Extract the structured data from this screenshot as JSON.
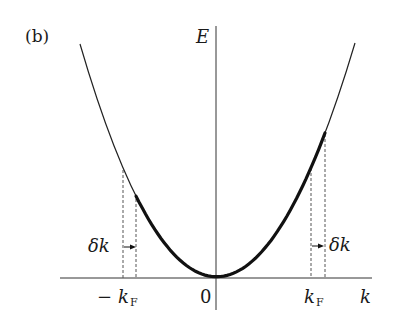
{
  "panel_label": "(b)",
  "axes": {
    "y_label": "E",
    "x_label": "k",
    "origin_label": "0"
  },
  "markers": {
    "neg_kf": {
      "sign": "−",
      "symbol": "k",
      "sub": "F"
    },
    "pos_kf": {
      "symbol": "k",
      "sub": "F"
    },
    "delta_k_left": "δk",
    "delta_k_right": "δk"
  },
  "chart_data": {
    "type": "line",
    "title": "(b)",
    "xlabel": "k",
    "ylabel": "E",
    "curve": "parabola E = k^2 (free-electron dispersion)",
    "x_ticks": [
      "−k_F",
      "0",
      "k_F"
    ],
    "highlighted_ranges": [
      {
        "label": "occupied states shifted by δk",
        "from": "−k_F + δk",
        "to": "k_F + δk",
        "style": "thick"
      }
    ],
    "annotations": [
      {
        "text": "δk",
        "at": "−k_F",
        "arrow": "right"
      },
      {
        "text": "δk",
        "at": "k_F",
        "arrow": "right"
      }
    ],
    "grid": false
  },
  "colors": {
    "ink": "#1a1a1a",
    "dash": "#555555"
  }
}
